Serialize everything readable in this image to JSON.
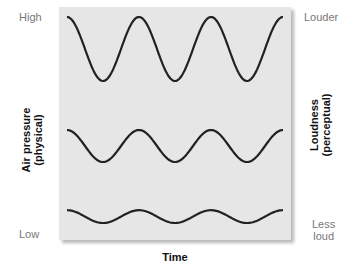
{
  "diagram": {
    "left_axis": {
      "title_line1": "Air pressure",
      "title_line2": "(physical)",
      "top_label": "High",
      "bottom_label": "Low"
    },
    "right_axis": {
      "title_line1": "Loudness",
      "title_line2": "(perceptual)",
      "top_label": "Louder",
      "bottom_label_line1": "Less",
      "bottom_label_line2": "loud"
    },
    "x_axis_title": "Time",
    "colors": {
      "panel": "#e6e6e6",
      "wave": "#222222",
      "label": "#777777"
    },
    "waves": [
      {
        "name": "loud",
        "relative_amplitude": 1.0,
        "cycles": 3
      },
      {
        "name": "medium",
        "relative_amplitude": 0.5,
        "cycles": 3
      },
      {
        "name": "soft",
        "relative_amplitude": 0.2,
        "cycles": 3
      }
    ]
  }
}
